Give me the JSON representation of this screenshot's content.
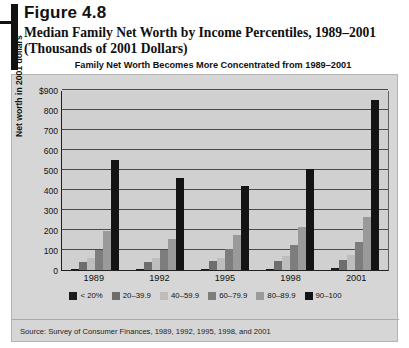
{
  "figure": {
    "number": "Figure 4.8",
    "title": "Median Family Net Worth by Income Percentiles, 1989–2001 (Thousands of 2001 Dollars)",
    "subtitle": "Family Net Worth Becomes More Concentrated from 1989–2001",
    "source": "Source: Survey of Consumer Finances, 1989, 1992, 1995, 1998, and 2001"
  },
  "chart_data": {
    "type": "bar",
    "title": "Family Net Worth Becomes More Concentrated from 1989–2001",
    "xlabel": "",
    "ylabel": "Net worth in 2001 dollars",
    "categories": [
      "1989",
      "1992",
      "1995",
      "1998",
      "2001"
    ],
    "ylim": [
      0,
      900
    ],
    "yticks": [
      0,
      100,
      200,
      300,
      400,
      500,
      600,
      700,
      800,
      900
    ],
    "ytick_labels": [
      "0",
      "100",
      "200",
      "300",
      "400",
      "500",
      "600",
      "700",
      "800",
      "$900"
    ],
    "grid": true,
    "legend_position": "bottom",
    "series": [
      {
        "name": "< 20%",
        "color": "#1c1c1c",
        "values": [
          5,
          5,
          6,
          7,
          8
        ]
      },
      {
        "name": "20–39.9",
        "color": "#6e6e6e",
        "values": [
          40,
          42,
          44,
          46,
          48
        ]
      },
      {
        "name": "40–59.9",
        "color": "#bdbdbd",
        "values": [
          62,
          58,
          60,
          68,
          75
        ]
      },
      {
        "name": "60–79.9",
        "color": "#7d7d7d",
        "values": [
          100,
          98,
          105,
          125,
          140
        ]
      },
      {
        "name": "80–89.9",
        "color": "#9a9a9a",
        "values": [
          195,
          155,
          175,
          215,
          265
        ]
      },
      {
        "name": "90–100",
        "color": "#141414",
        "values": [
          550,
          462,
          420,
          505,
          850
        ]
      }
    ]
  },
  "colors": {
    "panel_bg": "#d6d6d6",
    "plot_bg": "#d0d0d0",
    "axis": "#202020",
    "grid": "#4a4a4a",
    "text": "#111111"
  }
}
